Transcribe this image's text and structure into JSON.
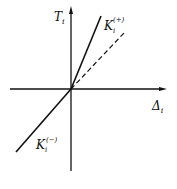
{
  "diagram": {
    "type": "piecewise-linear stiffness diagram",
    "axes": {
      "vertical": {
        "symbol": "T",
        "subscript": "i"
      },
      "horizontal": {
        "symbol": "Δ",
        "subscript": "i"
      }
    },
    "lines": [
      {
        "label": "K",
        "subscript": "i",
        "superscript": "(+)",
        "style": "solid",
        "quadrant": "first, steep"
      },
      {
        "label": "",
        "style": "dashed",
        "quadrant": "first, shallow"
      },
      {
        "label": "K",
        "subscript": "i",
        "superscript": "(−)",
        "style": "solid",
        "quadrant": "third"
      }
    ]
  }
}
